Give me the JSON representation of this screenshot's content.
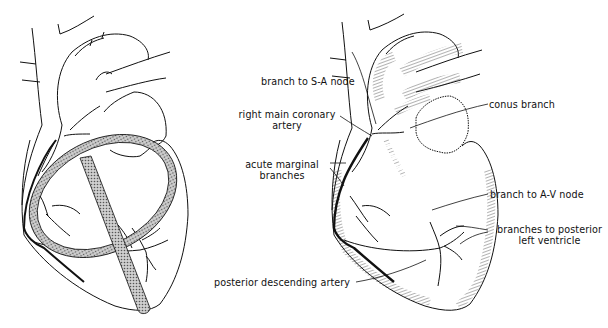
{
  "figure": {
    "left_panel": {
      "description": "Heart, anterior view, with shaded ring and stem overlay marking coronary artery course",
      "colors": {
        "line": "#111111",
        "overlay_fill": "#9a9a9a"
      }
    },
    "right_panel": {
      "description": "Heart, anterior view, right coronary artery branches labeled",
      "labels": {
        "sa_node": "branch to S-A node",
        "rca_line1": "right main coronary",
        "rca_line2": "artery",
        "acute_line1": "acute marginal",
        "acute_line2": "branches",
        "conus": "conus branch",
        "av_node": "branch to A-V node",
        "post_lv_line1": "branches to posterior",
        "post_lv_line2": "left ventricle",
        "pda": "posterior descending artery"
      }
    }
  }
}
